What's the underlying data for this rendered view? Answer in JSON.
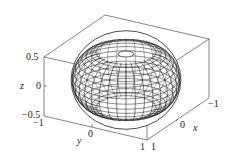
{
  "chart_data": {
    "type": "surface3d",
    "title": "",
    "surface": "torus (wireframe)",
    "xlabel": "x",
    "ylabel": "y",
    "zlabel": "z",
    "xlim": [
      -1,
      1
    ],
    "ylim": [
      -1,
      1
    ],
    "zlim": [
      -0.5,
      0.5
    ],
    "x_ticks": [
      "-1",
      "0",
      "1"
    ],
    "y_ticks": [
      "-1",
      "0",
      "1"
    ],
    "z_ticks": [
      "-0.5",
      "0",
      "0.5"
    ],
    "grid": false,
    "box": true,
    "line_color": "#000000",
    "fill_color": "#ffffff"
  },
  "labels": {
    "z_axis": "z",
    "y_axis": "y",
    "x_axis": "x",
    "z_top": "0.5",
    "z_mid": "0",
    "z_bottom": "−0.5",
    "y_left": "−1",
    "y_mid": "0",
    "y_right": "1",
    "x_near": "1",
    "x_mid": "0",
    "x_far": "−1"
  }
}
